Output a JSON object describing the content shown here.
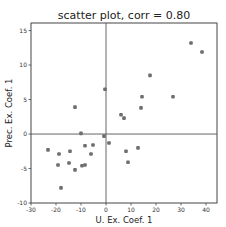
{
  "chart_data": {
    "type": "scatter",
    "title": "scatter plot, corr = 0.80",
    "xlabel": "U. Ex. Coef. 1",
    "ylabel": "Prec. Ex. Coef. 1",
    "xlim": [
      -30,
      44.4
    ],
    "ylim": [
      -10,
      16.1
    ],
    "xticks": [
      -30,
      -20,
      -10,
      0,
      10,
      20,
      30,
      40
    ],
    "yticks": [
      -10,
      -5,
      0,
      5,
      10,
      15
    ],
    "grid": false,
    "zero_lines": true,
    "marker_color": "#6e6e6e",
    "points": [
      {
        "x": -12.4,
        "y": 3.9
      },
      {
        "x": -0.4,
        "y": 6.5
      },
      {
        "x": 17.6,
        "y": 8.5
      },
      {
        "x": 14.4,
        "y": 5.4
      },
      {
        "x": 14.0,
        "y": 3.8
      },
      {
        "x": 6.0,
        "y": 2.8
      },
      {
        "x": 7.2,
        "y": 2.3
      },
      {
        "x": 26.8,
        "y": 5.4
      },
      {
        "x": 34.0,
        "y": 13.2
      },
      {
        "x": 38.4,
        "y": 11.9
      },
      {
        "x": -10.0,
        "y": 0.1
      },
      {
        "x": -0.8,
        "y": -0.3
      },
      {
        "x": 1.2,
        "y": -1.3
      },
      {
        "x": 8.0,
        "y": -2.5
      },
      {
        "x": 12.8,
        "y": -2.0
      },
      {
        "x": 8.8,
        "y": -4.1
      },
      {
        "x": -8.4,
        "y": -1.7
      },
      {
        "x": -5.2,
        "y": -1.6
      },
      {
        "x": -23.2,
        "y": -2.3
      },
      {
        "x": -18.8,
        "y": -2.9
      },
      {
        "x": -14.4,
        "y": -2.5
      },
      {
        "x": -6.0,
        "y": -2.9
      },
      {
        "x": -19.2,
        "y": -4.5
      },
      {
        "x": -14.8,
        "y": -4.2
      },
      {
        "x": -12.4,
        "y": -5.2
      },
      {
        "x": -9.6,
        "y": -4.6
      },
      {
        "x": -8.4,
        "y": -4.5
      },
      {
        "x": -18.0,
        "y": -7.8
      }
    ]
  }
}
